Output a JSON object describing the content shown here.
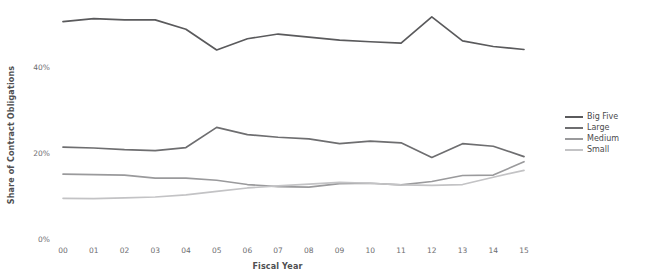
{
  "chart_data": {
    "type": "line",
    "title": "",
    "xlabel": "Fiscal Year",
    "ylabel": "Share of Contract Obligations",
    "categories": [
      "00",
      "01",
      "02",
      "03",
      "04",
      "05",
      "06",
      "07",
      "08",
      "09",
      "10",
      "11",
      "12",
      "13",
      "14",
      "15"
    ],
    "x": [
      0,
      1,
      2,
      3,
      4,
      5,
      6,
      7,
      8,
      9,
      10,
      11,
      12,
      13,
      14,
      15
    ],
    "xlim": [
      0,
      15
    ],
    "ylim": [
      0,
      56
    ],
    "yticks": [
      0,
      20,
      40
    ],
    "ytick_labels": [
      "0%",
      "20%",
      "40%"
    ],
    "xtick_labels": [
      "00",
      "01",
      "02",
      "03",
      "04",
      "05",
      "06",
      "07",
      "08",
      "09",
      "10",
      "11",
      "12",
      "13",
      "14",
      "15"
    ],
    "grid": false,
    "legend_position": "right",
    "units": "percent",
    "series": [
      {
        "name": "Big Five",
        "color": "#5a5a5c",
        "values": [
          50.8,
          51.5,
          51.2,
          51.2,
          49.0,
          44.2,
          46.8,
          47.9,
          47.2,
          46.5,
          46.1,
          45.8,
          51.9,
          46.3,
          45.0,
          44.3
        ]
      },
      {
        "name": "Large",
        "color": "#6e6e70",
        "values": [
          21.6,
          21.4,
          21.0,
          20.8,
          21.5,
          26.2,
          24.5,
          23.9,
          23.5,
          22.4,
          23.0,
          22.6,
          19.2,
          22.4,
          21.8,
          19.4
        ]
      },
      {
        "name": "Medium",
        "color": "#9a9a9c",
        "values": [
          15.3,
          15.2,
          15.1,
          14.4,
          14.4,
          13.9,
          12.9,
          12.4,
          12.3,
          13.1,
          13.2,
          12.8,
          13.6,
          15.0,
          15.1,
          18.2
        ]
      },
      {
        "name": "Small",
        "color": "#c3c3c5",
        "values": [
          9.7,
          9.6,
          9.8,
          10.0,
          10.5,
          11.3,
          12.1,
          12.6,
          13.0,
          13.4,
          13.2,
          12.8,
          12.7,
          12.9,
          14.6,
          16.2
        ]
      }
    ],
    "legend_entries": [
      "Big Five",
      "Large",
      "Medium",
      "Small"
    ]
  }
}
